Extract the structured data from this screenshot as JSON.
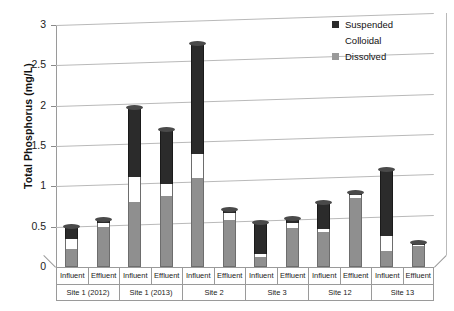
{
  "chart_data": {
    "type": "bar",
    "subtype": "stacked",
    "title": "",
    "xlabel": "",
    "ylabel": "Total Phosphorus (mg/L)",
    "ylim": [
      0,
      3
    ],
    "yticks": [
      "0",
      "0.5",
      "1",
      "1.5",
      "2",
      "2.5",
      "3"
    ],
    "ytick_values": [
      0,
      0.5,
      1,
      1.5,
      2,
      2.5,
      3
    ],
    "grid": true,
    "legend_position": "top-right",
    "categories": [
      "Influent",
      "Effluent",
      "Influent",
      "Effluent",
      "Influent",
      "Effluent",
      "Influent",
      "Effluent",
      "Influent",
      "Effluent",
      "Influent",
      "Effluent"
    ],
    "groups": [
      {
        "label": "Site 1 (2012)",
        "span": 2
      },
      {
        "label": "Site 1 (2013)",
        "span": 2
      },
      {
        "label": "Site 2",
        "span": 2
      },
      {
        "label": "Site 3",
        "span": 2
      },
      {
        "label": "Site 12",
        "span": 2
      },
      {
        "label": "Site 13",
        "span": 2
      }
    ],
    "series": [
      {
        "name": "Dissolved",
        "color": "#8f8f8f",
        "values": [
          0.22,
          0.49,
          0.8,
          0.88,
          1.1,
          0.58,
          0.13,
          0.48,
          0.43,
          0.86,
          0.2,
          0.26
        ]
      },
      {
        "name": "Colloidal",
        "color": "#ffffff",
        "values": [
          0.13,
          0.06,
          0.32,
          0.15,
          0.3,
          0.09,
          0.03,
          0.07,
          0.04,
          0.03,
          0.18,
          0.01
        ]
      },
      {
        "name": "Suspended",
        "color": "#2b2b2b",
        "values": [
          0.15,
          0.03,
          0.85,
          0.67,
          1.36,
          0.04,
          0.39,
          0.05,
          0.33,
          0.03,
          0.82,
          0.03
        ]
      }
    ],
    "totals": [
      0.5,
      0.58,
      1.97,
      1.7,
      2.76,
      0.71,
      0.55,
      0.6,
      0.8,
      0.92,
      1.2,
      0.3
    ],
    "legend": [
      {
        "label": "Suspended",
        "swatch": "sus"
      },
      {
        "label": "Colloidal",
        "swatch": "col"
      },
      {
        "label": "Dissolved",
        "swatch": "dis"
      }
    ],
    "colors": {
      "suspended": "#2b2b2b",
      "colloidal": "#ffffff",
      "dissolved": "#8f8f8f",
      "grid": "#b9b9b9",
      "axis": "#9a9a9a"
    }
  }
}
